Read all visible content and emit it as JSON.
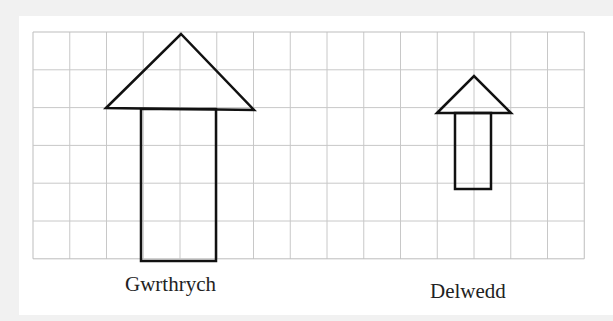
{
  "diagram": {
    "type": "enlargement-grid",
    "grid": {
      "columns": 15,
      "rows": 6,
      "origin_x": 33,
      "origin_y": 32,
      "cell_width": 36.75,
      "cell_height": 37.8,
      "line_color": "#c8c8c8",
      "border_color": "#bdbdbd"
    },
    "shapes": [
      {
        "name": "object-arrow",
        "stroke": "#111111",
        "triangle": [
          [
            106,
            108
          ],
          [
            181,
            34
          ],
          [
            254,
            110
          ]
        ],
        "rect": {
          "x": 141,
          "y": 109,
          "w": 75,
          "h": 152
        }
      },
      {
        "name": "image-arrow",
        "stroke": "#111111",
        "triangle": [
          [
            437,
            113
          ],
          [
            474,
            76
          ],
          [
            511,
            113
          ]
        ],
        "rect": {
          "x": 455,
          "y": 113,
          "w": 36,
          "h": 76
        }
      }
    ],
    "labels": {
      "object": "Gwrthrych",
      "image": "Delwedd"
    }
  }
}
